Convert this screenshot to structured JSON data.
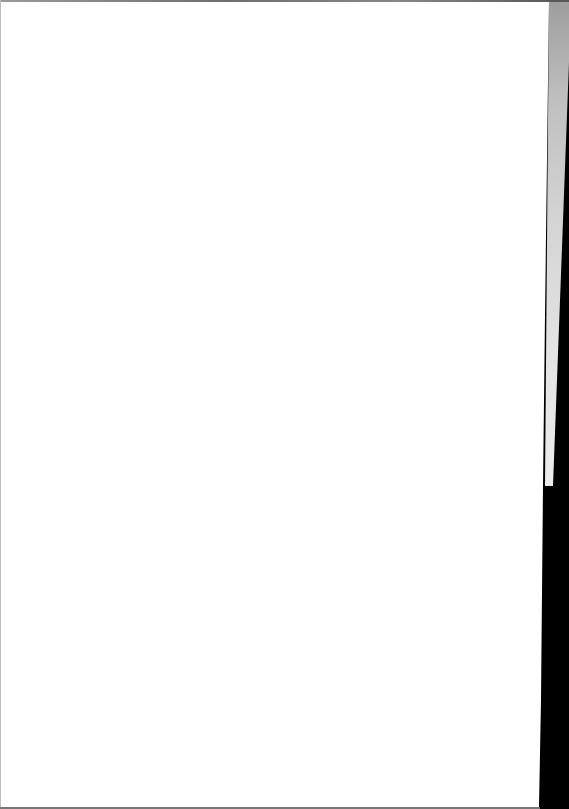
{
  "document": {
    "type": "scanned-page",
    "content": "",
    "state": "blank"
  },
  "colors": {
    "paper": "#ffffff",
    "scan_background": "#000000",
    "binding_shadow": "#c0c0c0"
  }
}
